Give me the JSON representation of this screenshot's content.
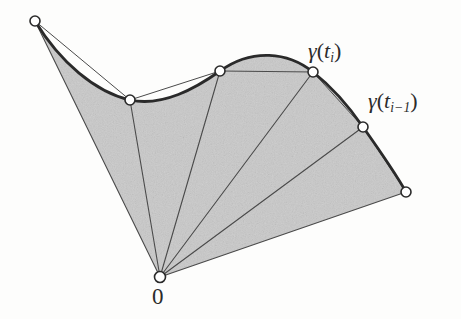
{
  "figure": {
    "background_color": "#fdfdfc",
    "fill_color": "#c9c9c9",
    "stroke_color": "#3a3a3a",
    "curve_color": "#2a2a2a",
    "vertex_fill": "#ffffff",
    "width": 461,
    "height": 319
  },
  "labels": {
    "gamma_ti": {
      "gamma": "γ",
      "open": "(",
      "t": "t",
      "sub": "i",
      "close": ")",
      "full_text": "γ(tᵢ)"
    },
    "gamma_ti_minus_1": {
      "gamma": "γ",
      "open": "(",
      "t": "t",
      "sub": "i−1",
      "close": ")",
      "full_text": "γ(tᵢ₋₁)"
    },
    "origin": {
      "text": "0"
    }
  },
  "chart_data": {
    "type": "line",
    "xlabel": "",
    "ylabel": "",
    "xlim": [
      0,
      461
    ],
    "ylim": [
      319,
      0
    ],
    "grid": false,
    "legend": "none",
    "origin": {
      "name": "0",
      "x": 160,
      "y": 277
    },
    "curve_points": [
      {
        "name": "p0",
        "x": 35,
        "y": 21
      },
      {
        "name": "p1",
        "x": 130,
        "y": 100
      },
      {
        "name": "p2",
        "x": 220,
        "y": 71
      },
      {
        "name": "p3",
        "x": 313,
        "y": 72,
        "label": "gamma_ti"
      },
      {
        "name": "p4",
        "x": 363,
        "y": 127,
        "label": "gamma_ti_minus_1"
      },
      {
        "name": "p5",
        "x": 406,
        "y": 192
      }
    ],
    "curve_path": "M 35 21 C 60 62, 95 92, 130 100 C 163 107, 196 88, 220 71 C 252 48, 288 52, 313 72 C 332 87, 350 108, 363 127 C 380 151, 396 174, 406 192",
    "chords": [
      {
        "from": "p0",
        "to": "p1"
      },
      {
        "from": "p1",
        "to": "p2"
      },
      {
        "from": "p2",
        "to": "p3"
      },
      {
        "from": "p3",
        "to": "p4"
      },
      {
        "from": "p4",
        "to": "p5"
      }
    ],
    "radii": [
      {
        "from": "0",
        "to": "p0"
      },
      {
        "from": "0",
        "to": "p1"
      },
      {
        "from": "0",
        "to": "p2"
      },
      {
        "from": "0",
        "to": "p3"
      },
      {
        "from": "0",
        "to": "p4"
      },
      {
        "from": "0",
        "to": "p5"
      }
    ],
    "shaded_region": "sector between origin and curve"
  }
}
